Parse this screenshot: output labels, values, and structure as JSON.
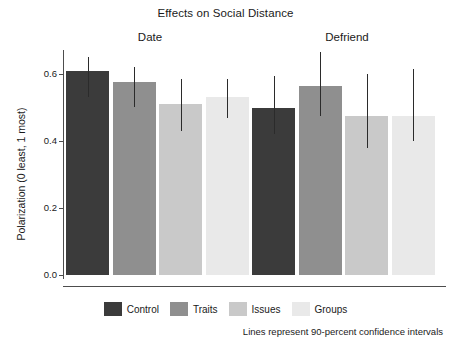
{
  "chart_data": {
    "type": "bar",
    "title": "Effects on Social Distance",
    "xlabel": "",
    "ylabel": "Polarization (0 least, 1 most)",
    "ylim": [
      0.0,
      0.7
    ],
    "yticks": [
      "0.0",
      "0.2",
      "0.4",
      "0.6"
    ],
    "ytick_values": [
      0.0,
      0.2,
      0.4,
      0.6
    ],
    "grid": false,
    "legend_position": "bottom",
    "panels": [
      "Date",
      "Defriend"
    ],
    "categories": [
      "Control",
      "Traits",
      "Issues",
      "Groups"
    ],
    "series": [
      {
        "name": "Date",
        "values": [
          0.61,
          0.575,
          0.51,
          0.53
        ],
        "ci_low": [
          0.53,
          0.5,
          0.43,
          0.47
        ],
        "ci_high": [
          0.65,
          0.62,
          0.585,
          0.585
        ]
      },
      {
        "name": "Defriend",
        "values": [
          0.5,
          0.565,
          0.475,
          0.475
        ],
        "ci_low": [
          0.42,
          0.475,
          0.38,
          0.4
        ],
        "ci_high": [
          0.595,
          0.665,
          0.6,
          0.615
        ]
      }
    ],
    "colors": {
      "Control": "#3b3b3b",
      "Traits": "#8f8f8f",
      "Issues": "#c9c9c9",
      "Groups": "#e9e9e9",
      "errorbar": "#2b2b2b",
      "axis": "#4d4d4d"
    },
    "annotation": "Lines represent 90-percent confidence intervals"
  },
  "legend": {
    "items": [
      {
        "label": "Control",
        "color": "#3b3b3b"
      },
      {
        "label": "Traits",
        "color": "#8f8f8f"
      },
      {
        "label": "Issues",
        "color": "#c9c9c9"
      },
      {
        "label": "Groups",
        "color": "#e9e9e9"
      }
    ]
  }
}
